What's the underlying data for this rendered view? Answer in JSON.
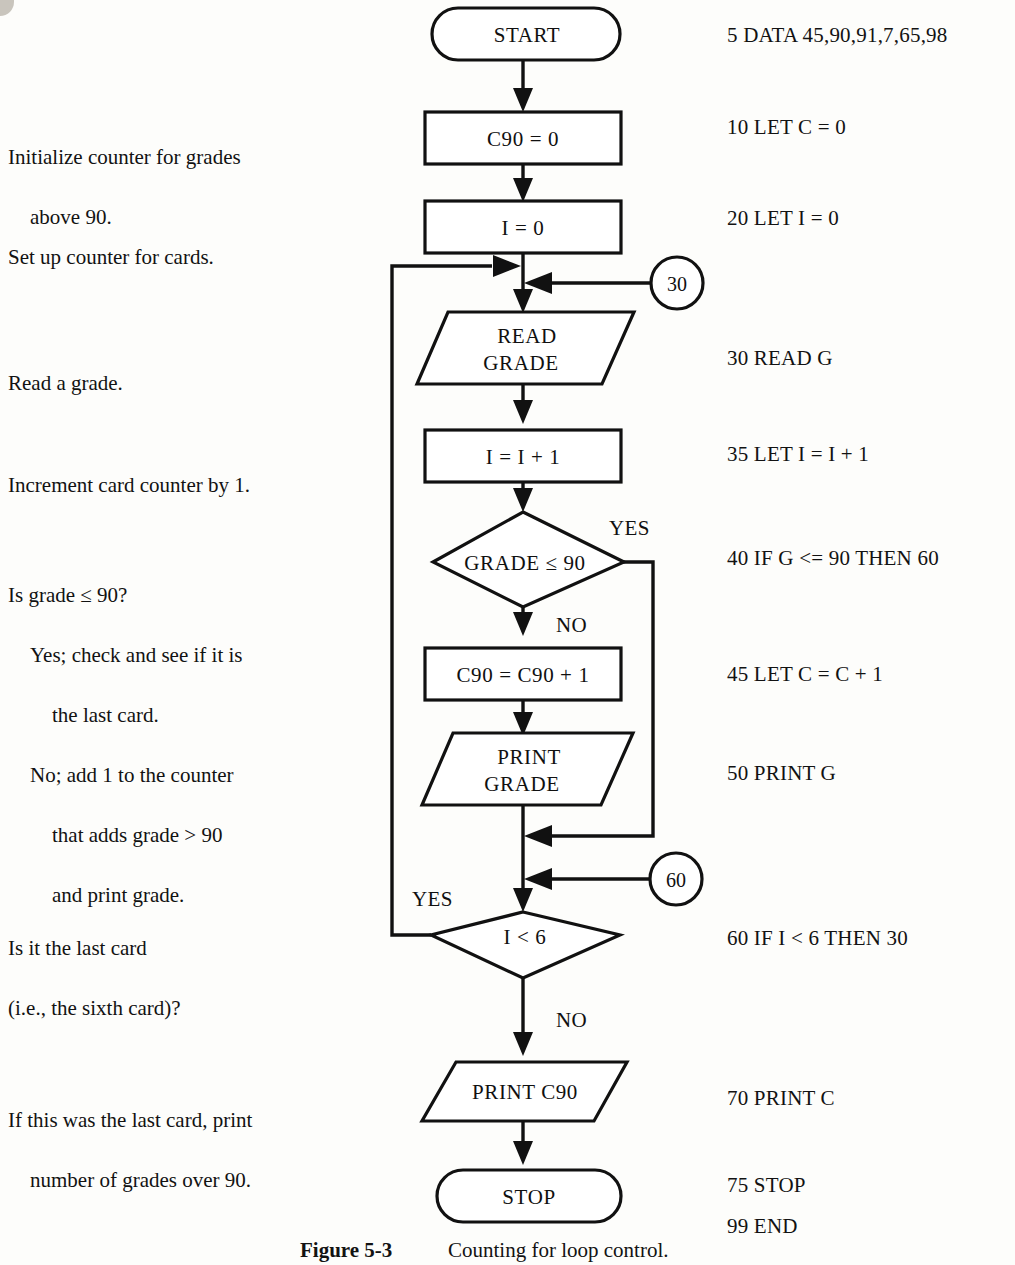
{
  "figure": {
    "caption_label": "Figure 5-3",
    "caption_text": "Counting for loop control."
  },
  "annotations": [
    {
      "id": "init-counter",
      "line1": "Initialize counter for grades",
      "line2": "above 90."
    },
    {
      "id": "setup-counter",
      "line1": "Set up counter for cards."
    },
    {
      "id": "read-grade",
      "line1": "Read a grade."
    },
    {
      "id": "increment",
      "line1": "Increment card counter by 1."
    },
    {
      "id": "is-grade",
      "line1": "Is grade ≤ 90?",
      "line2": "Yes; check and see if it is",
      "line3": "the last card.",
      "line4": "No; add 1 to the counter",
      "line5": "that adds grade > 90",
      "line6": "and print grade."
    },
    {
      "id": "last-card",
      "line1": "Is it the last card",
      "line2": "(i.e., the sixth card)?"
    },
    {
      "id": "print-count",
      "line1": "If this was the last card, print",
      "line2": "number of grades over 90."
    }
  ],
  "code_lines": [
    {
      "id": "line-5",
      "text": "5 DATA 45,90,91,7,65,98"
    },
    {
      "id": "line-10",
      "text": "10 LET C = 0"
    },
    {
      "id": "line-20",
      "text": "20 LET I = 0"
    },
    {
      "id": "line-30",
      "text": "30 READ G"
    },
    {
      "id": "line-35",
      "text": "35 LET I = I + 1"
    },
    {
      "id": "line-40",
      "text": "40 IF G <= 90 THEN 60"
    },
    {
      "id": "line-45",
      "text": "45 LET C = C + 1"
    },
    {
      "id": "line-50",
      "text": "50 PRINT G"
    },
    {
      "id": "line-60",
      "text": "60 IF I < 6 THEN 30"
    },
    {
      "id": "line-70",
      "text": "70 PRINT C"
    },
    {
      "id": "line-75",
      "text": "75 STOP"
    },
    {
      "id": "line-99",
      "text": "99 END"
    }
  ],
  "flowchart": {
    "nodes": {
      "start": {
        "type": "terminator",
        "label": "START"
      },
      "init_c90": {
        "type": "process",
        "label": "C90 = 0"
      },
      "init_i": {
        "type": "process",
        "label": "I = 0"
      },
      "read_grade": {
        "type": "io",
        "label_line1": "READ",
        "label_line2": "GRADE"
      },
      "incr_i": {
        "type": "process",
        "label": "I = I + 1"
      },
      "grade_test": {
        "type": "decision",
        "label": "GRADE ≤ 90"
      },
      "incr_c90": {
        "type": "process",
        "label": "C90 = C90 + 1"
      },
      "print_grade": {
        "type": "io",
        "label_line1": "PRINT",
        "label_line2": "GRADE"
      },
      "loop_test": {
        "type": "decision",
        "label": "I < 6"
      },
      "print_c90": {
        "type": "io",
        "label": "PRINT C90"
      },
      "stop": {
        "type": "terminator",
        "label": "STOP"
      }
    },
    "connectors": [
      {
        "id": "connector-30",
        "label": "30"
      },
      {
        "id": "connector-60",
        "label": "60"
      }
    ],
    "branch_labels": [
      {
        "id": "grade-test-yes",
        "text": "YES"
      },
      {
        "id": "grade-test-no",
        "text": "NO"
      },
      {
        "id": "loop-test-yes",
        "text": "YES"
      },
      {
        "id": "loop-test-no",
        "text": "NO"
      }
    ]
  },
  "colors": {
    "ink": "#111111",
    "paper": "#fdfdfb"
  }
}
